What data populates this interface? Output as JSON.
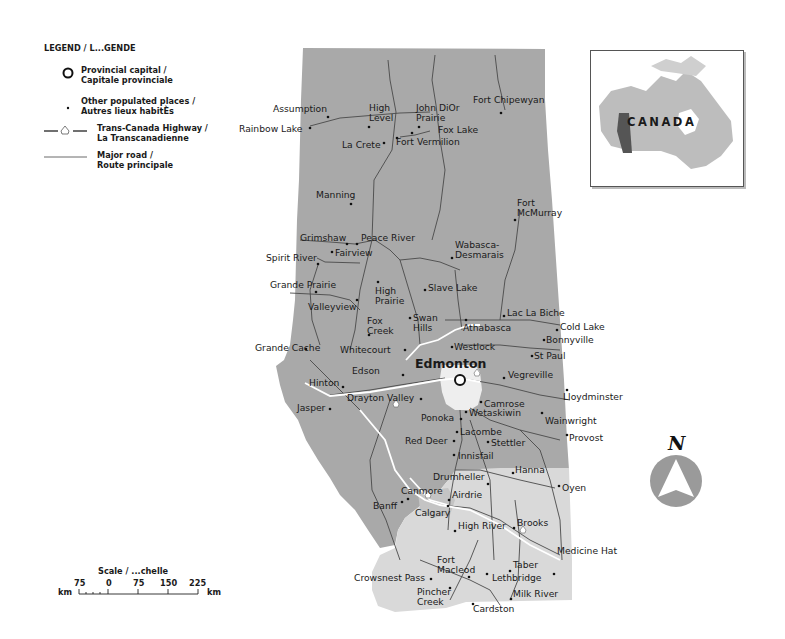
{
  "legend": {
    "title": "LEGEND / L...GENDE",
    "items": [
      {
        "symbol": "circle-outline",
        "line1": "Provincial capital /",
        "line2": "Capitale provinciale"
      },
      {
        "symbol": "dot",
        "line1": "Other populated places /",
        "line2": "Autres lieux habitÈs"
      },
      {
        "symbol": "trans-canada-highway",
        "line1": "Trans-Canada Highway /",
        "line2": "La Transcanadienne"
      },
      {
        "symbol": "line",
        "line1": "Major road /",
        "line2": "Route principale"
      }
    ]
  },
  "scale": {
    "title": "Scale / ...chelle",
    "unit_left": "km",
    "unit_right": "km",
    "ticks": [
      "75",
      "0",
      "75",
      "150",
      "225"
    ]
  },
  "inset": {
    "label": "CANADA",
    "highlight_color": "#555555",
    "base_color": "#bdbdbd"
  },
  "compass": {
    "label": "N",
    "color": "#9a9a9a"
  },
  "colors": {
    "forest_region": "#a9a9a9",
    "prairie_region": "#d9d9d9",
    "urban_area": "#eeeeee",
    "roads": "#555555",
    "highway": "#ffffff"
  },
  "map": {
    "capital": {
      "name": "Edmonton"
    },
    "places": [
      {
        "name": "Assumption"
      },
      {
        "name": "High\nLevel"
      },
      {
        "name": "John DiOr\nPrairie"
      },
      {
        "name": "Fort Chipewyan"
      },
      {
        "name": "Rainbow Lake"
      },
      {
        "name": "Fox Lake"
      },
      {
        "name": "La Crete"
      },
      {
        "name": "Fort Vermilion"
      },
      {
        "name": "Manning"
      },
      {
        "name": "Fort\nMcMurray"
      },
      {
        "name": "Grimshaw"
      },
      {
        "name": "Peace River"
      },
      {
        "name": "Spirit River"
      },
      {
        "name": "Fairview"
      },
      {
        "name": "Wabasca-\nDesmarais"
      },
      {
        "name": "Grande Prairie"
      },
      {
        "name": "High\nPrairie"
      },
      {
        "name": "Slave Lake"
      },
      {
        "name": "Valleyview"
      },
      {
        "name": "Fox\nCreek"
      },
      {
        "name": "Swan\nHills"
      },
      {
        "name": "Lac La Biche"
      },
      {
        "name": "Athabasca"
      },
      {
        "name": "Cold Lake"
      },
      {
        "name": "Bonnyville"
      },
      {
        "name": "Grande Cache"
      },
      {
        "name": "Whitecourt"
      },
      {
        "name": "Westlock"
      },
      {
        "name": "St Paul"
      },
      {
        "name": "Edson"
      },
      {
        "name": "Hinton"
      },
      {
        "name": "Vegreville"
      },
      {
        "name": "Lloydminster"
      },
      {
        "name": "Jasper"
      },
      {
        "name": "Drayton Valley"
      },
      {
        "name": "Camrose"
      },
      {
        "name": "Ponoka"
      },
      {
        "name": "Wetaskiwin"
      },
      {
        "name": "Wainwright"
      },
      {
        "name": "Red Deer"
      },
      {
        "name": "Lacombe"
      },
      {
        "name": "Stettler"
      },
      {
        "name": "Provost"
      },
      {
        "name": "Innisfail"
      },
      {
        "name": "Drumheller"
      },
      {
        "name": "Hanna"
      },
      {
        "name": "Oyen"
      },
      {
        "name": "Canmore"
      },
      {
        "name": "Airdrie"
      },
      {
        "name": "Banff"
      },
      {
        "name": "Calgary"
      },
      {
        "name": "High River"
      },
      {
        "name": "Brooks"
      },
      {
        "name": "Medicine Hat"
      },
      {
        "name": "Fort\nMacleod"
      },
      {
        "name": "Taber"
      },
      {
        "name": "Crowsnest Pass"
      },
      {
        "name": "Lethbridge"
      },
      {
        "name": "Pincher\nCreek"
      },
      {
        "name": "Milk River"
      },
      {
        "name": "Cardston"
      }
    ]
  }
}
